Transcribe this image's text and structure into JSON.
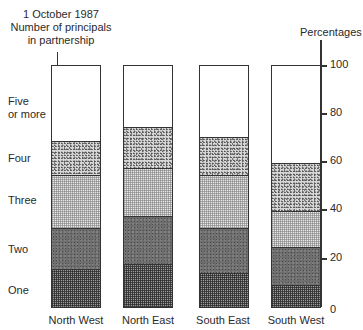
{
  "chart_data": {
    "type": "bar",
    "stacked": true,
    "title": "1 October 1987 Number of principals in partnership",
    "title_lines": [
      "1 October 1987",
      "Number of principals",
      "in partnership"
    ],
    "xlabel": "",
    "ylabel": "Percentages",
    "ylim": [
      0,
      100
    ],
    "yticks": [
      0,
      20,
      40,
      60,
      80,
      100
    ],
    "grid": false,
    "legend_position": "left (labels aligned with segments)",
    "categories": [
      "North West",
      "North East",
      "South East",
      "South West"
    ],
    "series": [
      {
        "name": "One",
        "values": [
          16,
          18,
          14,
          9
        ]
      },
      {
        "name": "Two",
        "values": [
          17,
          20,
          19,
          16
        ]
      },
      {
        "name": "Three",
        "values": [
          22,
          20,
          22,
          15
        ]
      },
      {
        "name": "Four",
        "values": [
          14,
          17,
          16,
          20
        ]
      },
      {
        "name": "Five or more",
        "values": [
          31,
          25,
          29,
          40
        ]
      }
    ]
  },
  "labels": {
    "title_line1": "1 October 1987",
    "title_line2": "Number of principals",
    "title_line3": "in partnership",
    "axis_title": "Percentages",
    "row_five_line1": "Five",
    "row_five_line2": "or more",
    "row_four": "Four",
    "row_three": "Three",
    "row_two": "Two",
    "row_one": "One",
    "tick_100": "100",
    "tick_80": "80",
    "tick_60": "60",
    "tick_40": "40",
    "tick_20": "20",
    "tick_0": "0",
    "cat_0": "North West",
    "cat_1": "North East",
    "cat_2": "South East",
    "cat_3": "South West"
  }
}
